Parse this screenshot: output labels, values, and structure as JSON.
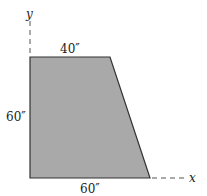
{
  "figure": {
    "type": "trapezoid-area-diagram",
    "axes": {
      "x_label": "x",
      "y_label": "y"
    },
    "dimensions": {
      "top_width": "40″",
      "left_height": "60″",
      "bottom_width": "60″"
    },
    "colors": {
      "fill": "#a9a9a9",
      "stroke": "#333333",
      "axis_dash": "#555555"
    }
  }
}
